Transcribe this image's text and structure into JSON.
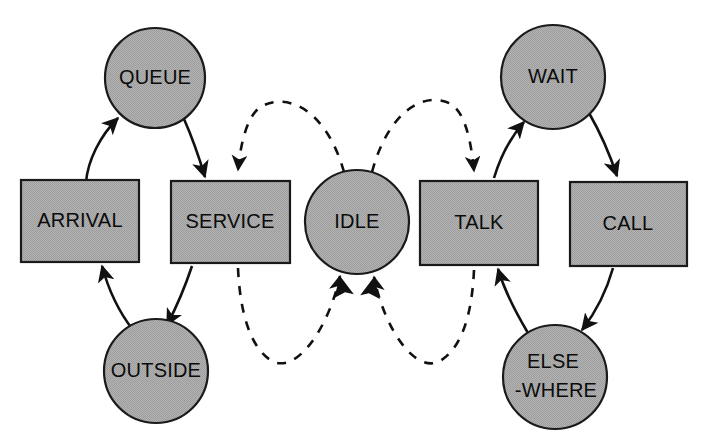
{
  "diagram": {
    "canvas": {
      "width": 708,
      "height": 448
    },
    "colors": {
      "node_fill": "#a8a8a8",
      "node_stroke": "#1a1a1a",
      "edge": "#111111",
      "label": "#0b0b0b",
      "background": "#ffffff"
    },
    "nodes": [
      {
        "id": "queue",
        "label": "QUEUE",
        "shape": "circle",
        "cx": 155,
        "cy": 78,
        "r": 50
      },
      {
        "id": "wait",
        "label": "WAIT",
        "shape": "circle",
        "cx": 553,
        "cy": 77,
        "r": 52
      },
      {
        "id": "idle",
        "label": "IDLE",
        "shape": "circle",
        "cx": 357,
        "cy": 222,
        "r": 52
      },
      {
        "id": "outside",
        "label": "OUTSIDE",
        "shape": "circle",
        "cx": 156,
        "cy": 371,
        "r": 52
      },
      {
        "id": "elsewhere",
        "label_line1": "ELSE",
        "label_line2": "-WHERE",
        "label": "ELSE-WHERE",
        "shape": "circle",
        "cx": 555,
        "cy": 377,
        "r": 52
      },
      {
        "id": "arrival",
        "label": "ARRIVAL",
        "shape": "rect",
        "x": 21,
        "y": 180,
        "w": 118,
        "h": 82
      },
      {
        "id": "service",
        "label": "SERVICE",
        "shape": "rect",
        "x": 171,
        "y": 181,
        "w": 119,
        "h": 82
      },
      {
        "id": "talk",
        "label": "TALK",
        "shape": "rect",
        "x": 420,
        "y": 181,
        "w": 118,
        "h": 84
      },
      {
        "id": "call",
        "label": "CALL",
        "shape": "rect",
        "x": 570,
        "y": 182,
        "w": 117,
        "h": 84
      }
    ],
    "edges": [
      {
        "id": "arrival-to-queue",
        "from": "ARRIVAL",
        "to": "QUEUE",
        "style": "solid"
      },
      {
        "id": "queue-to-service",
        "from": "QUEUE",
        "to": "SERVICE",
        "style": "solid"
      },
      {
        "id": "service-to-outside",
        "from": "SERVICE",
        "to": "OUTSIDE",
        "style": "solid"
      },
      {
        "id": "outside-to-arrival",
        "from": "OUTSIDE",
        "to": "ARRIVAL",
        "style": "solid"
      },
      {
        "id": "talk-to-wait",
        "from": "TALK",
        "to": "WAIT",
        "style": "solid"
      },
      {
        "id": "wait-to-call",
        "from": "WAIT",
        "to": "CALL",
        "style": "solid"
      },
      {
        "id": "call-to-elsewhere",
        "from": "CALL",
        "to": "ELSE-WHERE",
        "style": "solid"
      },
      {
        "id": "elsewhere-to-talk",
        "from": "ELSE-WHERE",
        "to": "TALK",
        "style": "solid"
      },
      {
        "id": "idle-to-service",
        "from": "IDLE",
        "to": "SERVICE",
        "style": "dashed"
      },
      {
        "id": "service-to-idle",
        "from": "SERVICE",
        "to": "IDLE",
        "style": "dashed"
      },
      {
        "id": "idle-to-talk",
        "from": "IDLE",
        "to": "TALK",
        "style": "dashed"
      },
      {
        "id": "talk-to-idle",
        "from": "TALK",
        "to": "IDLE",
        "style": "dashed"
      }
    ]
  }
}
